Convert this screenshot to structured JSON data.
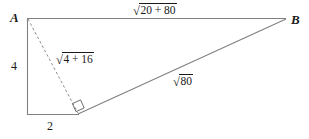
{
  "figure": {
    "type": "geometry-diagram",
    "background_color": "#ffffff",
    "stroke_color": "#7a7a7a",
    "text_color": "#1a1a1a",
    "vertices": {
      "a_label": "A",
      "b_label": "B"
    },
    "labels": {
      "top_side": {
        "name": "segment-AB-length",
        "radical_sign": "√",
        "radicand": "20 + 80",
        "plain": "√20 + 80"
      },
      "dashed_side": {
        "name": "dashed-segment-length",
        "radical_sign": "√",
        "radicand": "4 + 16",
        "plain": "√4 + 16"
      },
      "lower_side": {
        "name": "segment-to-B-length",
        "radical_sign": "√",
        "radicand": "80",
        "plain": "√80"
      },
      "vertical_leg": "4",
      "horizontal_leg": "2"
    },
    "right_angle_marker": "right-angle-square"
  }
}
